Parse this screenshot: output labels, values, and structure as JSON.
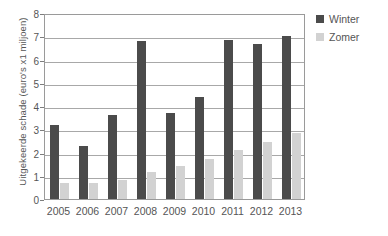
{
  "chart_data": {
    "type": "bar",
    "title": "",
    "subtitle": "",
    "xlabel": "",
    "ylabel": "Uitgekeerde schade (euro's x1 miljoen)",
    "categories": [
      "2005",
      "2006",
      "2007",
      "2008",
      "2009",
      "2010",
      "2011",
      "2012",
      "2013"
    ],
    "series": [
      {
        "name": "Winter",
        "color": "#4b4b4b",
        "values": [
          3.2,
          2.3,
          3.6,
          6.8,
          3.7,
          4.4,
          6.85,
          6.65,
          7.0
        ]
      },
      {
        "name": "Zomer",
        "color": "#d2d2d2",
        "values": [
          0.7,
          0.7,
          0.8,
          1.15,
          1.4,
          1.7,
          2.1,
          2.45,
          2.85
        ]
      }
    ],
    "ylim": [
      0,
      8
    ],
    "ytick_labels": [
      "0",
      "1",
      "2",
      "3",
      "4",
      "5",
      "6",
      "7",
      "8"
    ],
    "ytick_values": [
      0,
      1,
      2,
      3,
      4,
      5,
      6,
      7,
      8
    ],
    "grid": true,
    "grid_axis": "y",
    "legend_position": "right-top",
    "legend_entries": [
      "Winter",
      "Zomer"
    ]
  }
}
